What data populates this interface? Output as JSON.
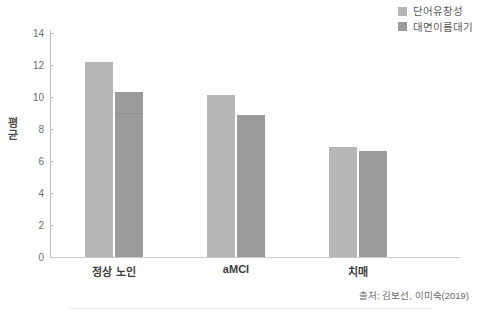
{
  "chart_data": {
    "type": "bar",
    "title": "",
    "xlabel": "",
    "ylabel": "평균",
    "ylim": [
      0,
      15
    ],
    "yticks": [
      0,
      2,
      4,
      6,
      8,
      10,
      12,
      14
    ],
    "grid": false,
    "legend_position": "top-right",
    "categories": [
      "정상 노인",
      "aMCI",
      "치매"
    ],
    "series": [
      {
        "name": "단어유창성",
        "color": "#b6b6b6",
        "values": [
          12.2,
          10.1,
          6.9
        ]
      },
      {
        "name": "대면이름대기",
        "color": "#9b9b9b",
        "values": [
          10.3,
          8.9,
          6.6
        ]
      }
    ],
    "annotations": [
      {
        "text": "출처: 김보선, 이미숙(2019)",
        "position": "bottom-right"
      }
    ]
  },
  "legend": {
    "items": [
      {
        "label": "단어유창성",
        "color": "#b6b6b6"
      },
      {
        "label": "대면이름대기",
        "color": "#9b9b9b"
      }
    ]
  },
  "axes": {
    "y_title_chars": [
      "평",
      "균"
    ],
    "y_title": "평균",
    "tick_labels": [
      "14",
      "12",
      "10",
      "8",
      "6",
      "4",
      "2",
      "0"
    ],
    "category_labels": [
      "정상 노인",
      "aMCI",
      "치매"
    ]
  },
  "footer": {
    "source": "출처: 김보선, 이미숙(2019)"
  }
}
